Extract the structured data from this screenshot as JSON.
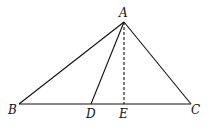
{
  "diagram": {
    "type": "geometry-triangle",
    "points": {
      "A": {
        "label": "A",
        "x": 124,
        "y": 22
      },
      "B": {
        "label": "B",
        "x": 19,
        "y": 104
      },
      "C": {
        "label": "C",
        "x": 191,
        "y": 104
      },
      "D": {
        "label": "D",
        "x": 91,
        "y": 104
      },
      "E": {
        "label": "E",
        "x": 124,
        "y": 104
      }
    },
    "segments": [
      {
        "from": "A",
        "to": "B",
        "style": "solid"
      },
      {
        "from": "A",
        "to": "C",
        "style": "solid"
      },
      {
        "from": "B",
        "to": "C",
        "style": "solid"
      },
      {
        "from": "A",
        "to": "D",
        "style": "solid"
      },
      {
        "from": "A",
        "to": "E",
        "style": "dashed"
      }
    ],
    "labels": {
      "A": "A",
      "B": "B",
      "C": "C",
      "D": "D",
      "E": "E"
    },
    "colors": {
      "stroke": "#111111",
      "background": "#ffffff"
    }
  }
}
